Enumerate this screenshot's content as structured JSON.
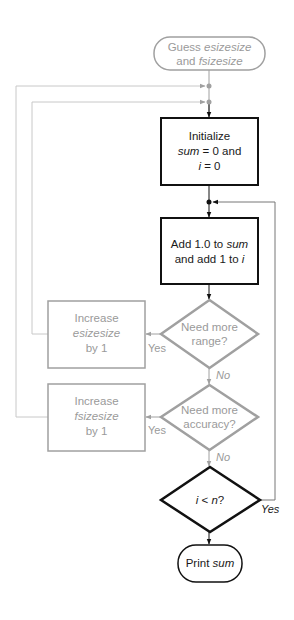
{
  "colors": {
    "dark": "#111111",
    "gray": "#a0a0a0",
    "light_line": "#c8c8c8",
    "text_dark": "#1a1a1a",
    "text_gray": "#9a9a9a"
  },
  "nodes": {
    "start": {
      "line1_plain": "Guess ",
      "line1_italic": "esizesize",
      "line2_plain": "and ",
      "line2_italic": "fsizesize"
    },
    "init": {
      "line1": "Initialize",
      "line2_italic": "sum",
      "line2_plain": " = 0 and",
      "line3_italic": "i",
      "line3_plain": " = 0"
    },
    "add": {
      "line1_plain": "Add 1.0 to ",
      "line1_italic": "sum",
      "line2_plain": "and add 1 to ",
      "line2_italic": "i"
    },
    "range_decision": {
      "line1": "Need more",
      "line2": "range?"
    },
    "inc_esize": {
      "line1": "Increase",
      "line2_italic": "esizesize",
      "line3": "by 1"
    },
    "accuracy_decision": {
      "line1": "Need more",
      "line2": "accuracy?"
    },
    "inc_fsize": {
      "line1": "Increase",
      "line2_italic": "fsizesize",
      "line3": "by 1"
    },
    "loop_decision": {
      "italic_i": "i",
      "plain_lt": " < ",
      "italic_n": "n",
      "plain_q": "?"
    },
    "print": {
      "plain": "Print ",
      "italic": "sum"
    }
  },
  "edge_labels": {
    "range_yes": "Yes",
    "range_no": "No",
    "accuracy_yes": "Yes",
    "accuracy_no": "No",
    "loop_yes": "Yes"
  }
}
